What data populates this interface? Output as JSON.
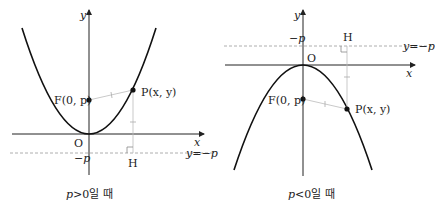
{
  "panels": [
    {
      "id": "p-positive",
      "caption": "p>0일 때",
      "caption_var": "p",
      "caption_rest": ">0일 때",
      "labels": {
        "y_axis": "y",
        "x_axis": "x",
        "origin": "O",
        "focus": "F(0, p)",
        "point": "P(x, y)",
        "foot": "H",
        "directrix_value": "−p",
        "directrix_eq": "y=−p"
      }
    },
    {
      "id": "p-negative",
      "caption": "p<0일 때",
      "caption_var": "p",
      "caption_rest": "<0일 때",
      "labels": {
        "y_axis": "y",
        "x_axis": "x",
        "origin": "O",
        "focus": "F(0, p)",
        "point": "P(x, y)",
        "foot": "H",
        "directrix_value": "−p",
        "directrix_eq": "y=−p"
      }
    }
  ],
  "colors": {
    "curve": "#111111",
    "axis": "#222222",
    "guide": "#aaaaaa",
    "directrix": "#999999"
  }
}
